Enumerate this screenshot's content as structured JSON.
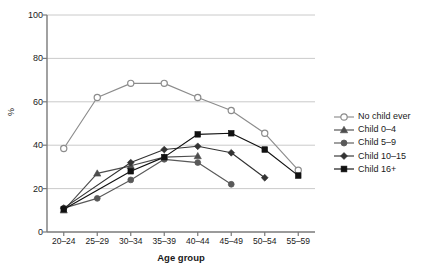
{
  "chart_data": {
    "type": "line",
    "title": "",
    "xlabel": "Age group",
    "ylabel": "%",
    "categories": [
      "20–24",
      "25–29",
      "30–34",
      "35–39",
      "40–44",
      "45–49",
      "50–54",
      "55–59"
    ],
    "ylim": [
      0,
      100
    ],
    "yticks": [
      0,
      20,
      40,
      60,
      80,
      100
    ],
    "grid": "horizontal",
    "legend_position": "right",
    "series": [
      {
        "name": "No child ever",
        "marker": "open-circle",
        "color": "#8c8c8c",
        "values": [
          38.5,
          62.0,
          68.5,
          68.5,
          62.0,
          56.0,
          45.5,
          28.5
        ]
      },
      {
        "name": "Child 0–4",
        "marker": "triangle",
        "color": "#4d4d4d",
        "values": [
          10.0,
          27.0,
          30.5,
          34.5,
          35.0,
          null,
          null,
          null
        ]
      },
      {
        "name": "Child 5–9",
        "marker": "filled-circle",
        "color": "#595959",
        "values": [
          11.0,
          15.5,
          24.0,
          33.5,
          32.0,
          22.0,
          null,
          null
        ]
      },
      {
        "name": "Child 10–15",
        "marker": "diamond",
        "color": "#333333",
        "values": [
          11.0,
          null,
          32.0,
          38.0,
          39.5,
          36.5,
          25.0,
          null
        ]
      },
      {
        "name": "Child 16+",
        "marker": "filled-square",
        "color": "#111111",
        "values": [
          10.5,
          null,
          28.0,
          34.5,
          45.0,
          45.5,
          38.0,
          26.0
        ]
      }
    ]
  },
  "axis": {
    "ytick_labels": [
      "0",
      "20",
      "40",
      "60",
      "80",
      "100"
    ],
    "ylabel_text": "%",
    "xlabel_text": "Age group",
    "xtick_labels": [
      "20–24",
      "25–29",
      "30–34",
      "35–39",
      "40–44",
      "45–49",
      "50–54",
      "55–59"
    ]
  },
  "legend": {
    "items": [
      {
        "label": "No child ever"
      },
      {
        "label": "Child 0–4"
      },
      {
        "label": "Child 5–9"
      },
      {
        "label": "Child 10–15"
      },
      {
        "label": "Child 16+"
      }
    ]
  },
  "caption": {
    "text": ""
  }
}
